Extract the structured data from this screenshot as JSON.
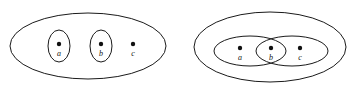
{
  "figure": {
    "background_color": "#ffffff",
    "stroke_color": "#1a1a1a",
    "dot_color": "#111111",
    "panel_count": 2,
    "panels": [
      {
        "id": "left-panel",
        "name": "disjoint-neighborhoods-diagram",
        "outer_set": {
          "name": "outer-ellipse",
          "shape": "ellipse",
          "cx": 88,
          "cy": 46,
          "rx": 78,
          "ry": 33
        },
        "inner_sets": [
          {
            "name": "inner-oval-a",
            "shape": "ellipse",
            "cx": 59,
            "cy": 46,
            "rx": 11,
            "ry": 16
          },
          {
            "name": "inner-oval-b",
            "shape": "ellipse",
            "cx": 101,
            "cy": 46,
            "rx": 11,
            "ry": 16
          }
        ],
        "points": [
          {
            "label": "a",
            "cx": 59,
            "cy": 44,
            "r": 2.2,
            "label_x": 59,
            "label_y": 56,
            "enclosed_by": "inner-oval-a"
          },
          {
            "label": "b",
            "cx": 101,
            "cy": 44,
            "r": 2.2,
            "label_x": 101,
            "label_y": 56,
            "enclosed_by": "inner-oval-b"
          },
          {
            "label": "c",
            "cx": 133,
            "cy": 44,
            "r": 2.2,
            "label_x": 133,
            "label_y": 56,
            "enclosed_by": "outer-ellipse"
          }
        ]
      },
      {
        "id": "right-panel",
        "name": "overlapping-neighborhoods-diagram",
        "outer_set": {
          "name": "outer-ellipse",
          "shape": "ellipse",
          "cx": 270,
          "cy": 47,
          "rx": 76,
          "ry": 35
        },
        "inner_sets": [
          {
            "name": "inner-ellipse-left",
            "shape": "ellipse",
            "cx": 250,
            "cy": 51,
            "rx": 36,
            "ry": 15
          },
          {
            "name": "inner-ellipse-right",
            "shape": "ellipse",
            "cx": 292,
            "cy": 51,
            "rx": 36,
            "ry": 15
          }
        ],
        "points": [
          {
            "label": "a",
            "cx": 240,
            "cy": 48,
            "r": 2.2,
            "label_x": 240,
            "label_y": 60,
            "enclosed_by": "inner-ellipse-left"
          },
          {
            "label": "b",
            "cx": 271,
            "cy": 48,
            "r": 2.2,
            "label_x": 271,
            "label_y": 60,
            "enclosed_by": "overlap-region"
          },
          {
            "label": "c",
            "cx": 300,
            "cy": 48,
            "r": 2.2,
            "label_x": 300,
            "label_y": 60,
            "enclosed_by": "inner-ellipse-right"
          }
        ]
      }
    ]
  }
}
